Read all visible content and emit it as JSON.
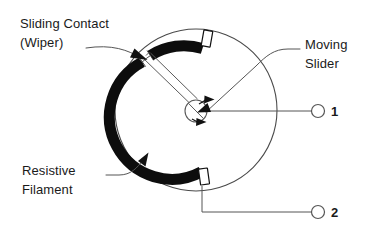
{
  "figure": {
    "kind": "potentiometer-cross-section-diagram",
    "background_color": "#ffffff",
    "ink_color": "#1a1a1a"
  },
  "labels": {
    "sliding_contact_line1": "Sliding Contact",
    "sliding_contact_line2": "(Wiper)",
    "resistive_line1": "Resistive",
    "resistive_line2": "Filament",
    "moving_slider_line1": "Moving",
    "moving_slider_line2": "Slider"
  },
  "terminals": [
    {
      "name": "terminal-1",
      "label": "1"
    },
    {
      "name": "terminal-2",
      "label": "2"
    }
  ],
  "colors": {
    "resistive_band": "#0d0d0d",
    "outline": "#555555",
    "body_outline": "#4a4a4a",
    "tab_fill": "#ffffff",
    "text": "#1a1a1a"
  }
}
